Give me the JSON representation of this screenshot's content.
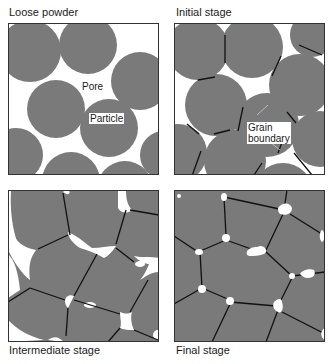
{
  "figure": {
    "colors": {
      "particle": "#7a7a7a",
      "pore": "#ffffff",
      "boundary": "#111111",
      "frame": "#333333"
    },
    "panels": [
      {
        "id": "loose-powder",
        "label": "Loose powder",
        "callouts": [
          "Pore",
          "Particle"
        ]
      },
      {
        "id": "initial-stage",
        "label": "Initial stage",
        "callouts": [
          "Grain",
          "boundary"
        ]
      },
      {
        "id": "intermediate-stage",
        "label": "Intermediate stage",
        "callouts": []
      },
      {
        "id": "final-stage",
        "label": "Final stage",
        "callouts": []
      }
    ]
  }
}
